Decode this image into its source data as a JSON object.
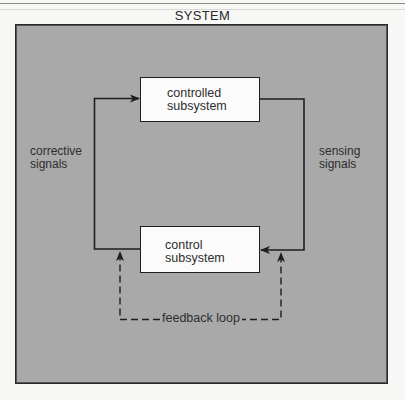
{
  "diagram": {
    "title": "SYSTEM",
    "nodes": {
      "controlled": {
        "line1": "controlled",
        "line2": "subsystem"
      },
      "control": {
        "line1": "control",
        "line2": "subsystem"
      }
    },
    "edges": {
      "corrective": {
        "line1": "corrective",
        "line2": "signals"
      },
      "sensing": {
        "line1": "sensing",
        "line2": "signals"
      },
      "feedback": "feedback loop"
    },
    "colors": {
      "system_fill": "#a9a9a9",
      "box_fill": "#fbfbfb",
      "line": "#1e1e1e",
      "page": "#f7f7f5"
    }
  }
}
